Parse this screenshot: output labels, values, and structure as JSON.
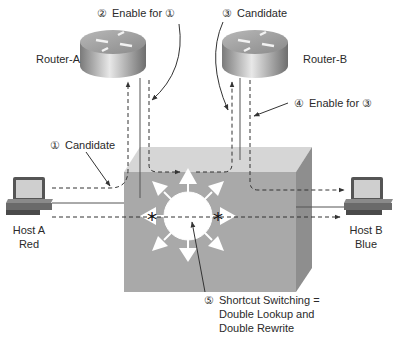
{
  "diagram": {
    "nodes": {
      "router_a": {
        "label": "Router-A"
      },
      "router_b": {
        "label": "Router-B"
      },
      "host_a": {
        "label_line1": "Host A",
        "label_line2": "Red"
      },
      "host_b": {
        "label_line1": "Host B",
        "label_line2": "Blue"
      },
      "switch": {
        "label": ""
      }
    },
    "annotations": {
      "step1": {
        "marker": "①",
        "text": "Candidate"
      },
      "step2": {
        "marker": "②",
        "text": "Enable for ①"
      },
      "step3": {
        "marker": "③",
        "text": "Candidate"
      },
      "step4": {
        "marker": "④",
        "text": "Enable for ③"
      },
      "step5": {
        "marker": "⑤",
        "line1": "Shortcut Switching =",
        "line2": "Double Lookup and",
        "line3": "Double Rewrite"
      }
    },
    "colors": {
      "cube_front": "#a8a8a8",
      "cube_top": "#d4d4d4",
      "cube_side": "#8c8c8c",
      "router_body": "#9a9a9a",
      "line": "#333333"
    }
  }
}
